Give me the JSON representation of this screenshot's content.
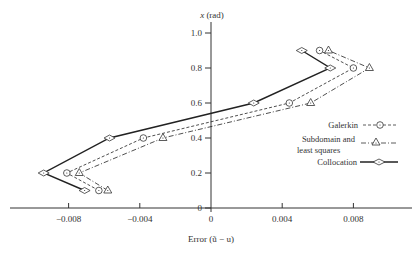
{
  "chart_data": {
    "type": "line",
    "title": "",
    "xlabel": "Error (ũ − u)",
    "ylabel": "x (rad)",
    "xlim": [
      -0.011,
      0.0113
    ],
    "ylim": [
      0,
      1.0
    ],
    "grid": false,
    "legend_position": "right",
    "x_ticks": [
      -0.008,
      -0.004,
      0,
      0.004,
      0.008
    ],
    "x_tick_labels": [
      "−0.008",
      "−0.004",
      "0",
      "0.004",
      "0.008"
    ],
    "y_ticks": [
      0,
      0.2,
      0.4,
      0.6,
      0.8,
      1.0
    ],
    "y_tick_labels": [
      "0",
      "0.2",
      "0.4",
      "0.6",
      "0.8",
      "1.0"
    ],
    "series": [
      {
        "name": "Galerkin",
        "marker": "circle-dot",
        "line_style": "dashed",
        "points": [
          {
            "error": -0.0063,
            "x": 0.1
          },
          {
            "error": -0.0081,
            "x": 0.2
          },
          {
            "error": -0.0038,
            "x": 0.4
          },
          {
            "error": 0.0044,
            "x": 0.6
          },
          {
            "error": 0.008,
            "x": 0.8
          },
          {
            "error": 0.0061,
            "x": 0.9
          }
        ]
      },
      {
        "name": "Subdomain and least squares",
        "marker": "triangle-dot",
        "line_style": "dash-dot",
        "points": [
          {
            "error": -0.0058,
            "x": 0.1
          },
          {
            "error": -0.0074,
            "x": 0.2
          },
          {
            "error": -0.0027,
            "x": 0.4
          },
          {
            "error": 0.0056,
            "x": 0.6
          },
          {
            "error": 0.0089,
            "x": 0.8
          },
          {
            "error": 0.0066,
            "x": 0.9
          }
        ]
      },
      {
        "name": "Collocation",
        "marker": "diamond-dot",
        "line_style": "solid",
        "points": [
          {
            "error": -0.0071,
            "x": 0.1
          },
          {
            "error": -0.0094,
            "x": 0.2
          },
          {
            "error": -0.0057,
            "x": 0.4
          },
          {
            "error": 0.0024,
            "x": 0.6
          },
          {
            "error": 0.0067,
            "x": 0.8
          },
          {
            "error": 0.0051,
            "x": 0.9
          }
        ]
      }
    ]
  },
  "legend": {
    "galerkin": "Galerkin",
    "subdomain_line1": "Subdomain and",
    "subdomain_line2": "least squares",
    "collocation": "Collocation"
  },
  "axes": {
    "y_title_var": "x",
    "y_title_unit": "(rad)",
    "x_title": "Error (ũ − u)"
  }
}
